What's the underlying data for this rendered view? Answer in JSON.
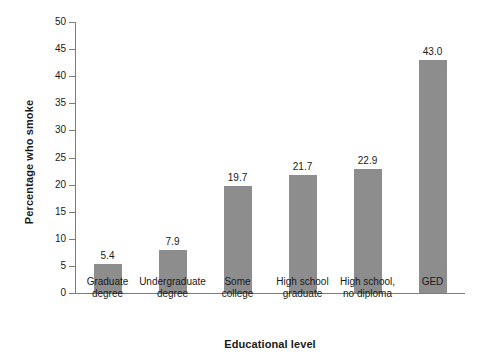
{
  "chart_data": {
    "type": "bar",
    "title": "",
    "xlabel": "Educational level",
    "ylabel": "Percentage who smoke",
    "categories": [
      "Graduate\ndegree",
      "Undergraduate\ndegree",
      "Some\ncollege",
      "High school\ngraduate",
      "High school,\nno diploma",
      "GED"
    ],
    "category_lines": [
      [
        "Graduate",
        "degree"
      ],
      [
        "Undergraduate",
        "degree"
      ],
      [
        "Some",
        "college"
      ],
      [
        "High school",
        "graduate"
      ],
      [
        "High school,",
        "no diploma"
      ],
      [
        "GED"
      ]
    ],
    "values": [
      5.4,
      7.9,
      19.7,
      21.7,
      22.9,
      43.0
    ],
    "value_labels": [
      "5.4",
      "7.9",
      "19.7",
      "21.7",
      "22.9",
      "43.0"
    ],
    "ylim": [
      0,
      50
    ],
    "yticks": [
      0,
      5,
      10,
      15,
      20,
      25,
      30,
      35,
      40,
      45,
      50
    ],
    "ytick_labels": [
      "0",
      "5",
      "10",
      "15",
      "20",
      "25",
      "30",
      "35",
      "40",
      "45",
      "50"
    ],
    "grid": false,
    "legend": null,
    "bar_color": "#8d8d8d",
    "axis_color": "#7d7d7d",
    "background": "#ffffff"
  }
}
